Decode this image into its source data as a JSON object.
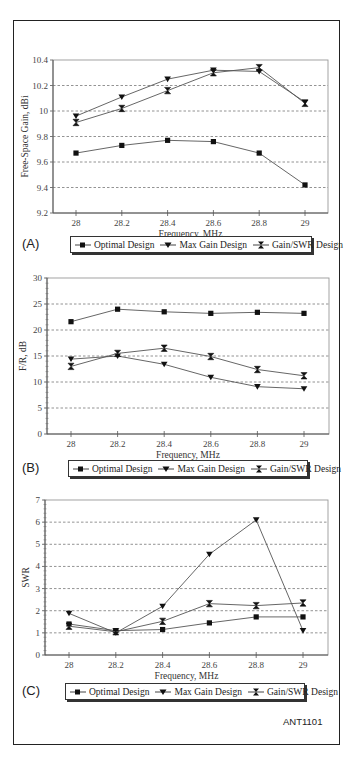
{
  "figure_id": "ANT1101",
  "legend": {
    "optimal": "Optimal Design",
    "maxgain": "Max Gain Design",
    "gainswr": "Gain/SWR Design"
  },
  "chart_data": [
    {
      "type": "line",
      "panel": "(A)",
      "title": "",
      "xlabel": "Frequency, MHz",
      "ylabel": "Free-Space Gain, dBi",
      "x": [
        28,
        28.2,
        28.4,
        28.6,
        28.8,
        29
      ],
      "x_tick_labels": [
        "28",
        "28.2",
        "28.4",
        "28.6",
        "28.8",
        "29"
      ],
      "ylim": [
        9.2,
        10.4
      ],
      "y_ticks": [
        "9.2",
        "9.4",
        "9.6",
        "9.8",
        "10",
        "10.2",
        "10.4"
      ],
      "grid": "horizontal dashed",
      "legend_position": "bottom",
      "series": [
        {
          "name": "Optimal Design",
          "marker": "square",
          "values": [
            9.67,
            9.73,
            9.77,
            9.76,
            9.67,
            9.42
          ]
        },
        {
          "name": "Max Gain Design",
          "marker": "triangle-down",
          "values": [
            9.96,
            10.11,
            10.25,
            10.32,
            10.31,
            10.07
          ]
        },
        {
          "name": "Gain/SWR Design",
          "marker": "hourglass",
          "values": [
            9.91,
            10.02,
            10.16,
            10.3,
            10.34,
            10.06
          ]
        }
      ]
    },
    {
      "type": "line",
      "panel": "(B)",
      "title": "",
      "xlabel": "Frequency, MHz",
      "ylabel": "F/R, dB",
      "x": [
        28,
        28.2,
        28.4,
        28.6,
        28.8,
        29
      ],
      "x_tick_labels": [
        "28",
        "28.2",
        "28.4",
        "28.6",
        "28.8",
        "29"
      ],
      "ylim": [
        0,
        30
      ],
      "y_ticks": [
        "0",
        "5",
        "10",
        "15",
        "20",
        "25",
        "30"
      ],
      "grid": "horizontal dashed",
      "legend_position": "bottom",
      "series": [
        {
          "name": "Optimal Design",
          "marker": "square",
          "values": [
            21.6,
            24.0,
            23.5,
            23.2,
            23.4,
            23.2
          ]
        },
        {
          "name": "Max Gain Design",
          "marker": "triangle-down",
          "values": [
            14.4,
            15.0,
            13.4,
            10.9,
            9.1,
            8.7
          ]
        },
        {
          "name": "Gain/SWR Design",
          "marker": "hourglass",
          "values": [
            13.0,
            15.5,
            16.5,
            14.9,
            12.4,
            11.2
          ]
        }
      ]
    },
    {
      "type": "line",
      "panel": "(C)",
      "title": "",
      "xlabel": "Frequency, MHz",
      "ylabel": "SWR",
      "x": [
        28,
        28.2,
        28.4,
        28.6,
        28.8,
        29
      ],
      "x_tick_labels": [
        "28",
        "28.2",
        "28.4",
        "28.6",
        "28.8",
        "29"
      ],
      "ylim": [
        0,
        7
      ],
      "y_ticks": [
        "0",
        "1",
        "2",
        "3",
        "4",
        "5",
        "6",
        "7"
      ],
      "grid": "horizontal dashed",
      "legend_position": "bottom",
      "series": [
        {
          "name": "Optimal Design",
          "marker": "square",
          "values": [
            1.4,
            1.1,
            1.15,
            1.45,
            1.72,
            1.72
          ]
        },
        {
          "name": "Max Gain Design",
          "marker": "triangle-down",
          "values": [
            1.88,
            1.0,
            2.2,
            4.55,
            6.1,
            1.1
          ]
        },
        {
          "name": "Gain/SWR Design",
          "marker": "hourglass",
          "values": [
            1.3,
            1.05,
            1.52,
            2.32,
            2.23,
            2.35
          ]
        }
      ]
    }
  ]
}
